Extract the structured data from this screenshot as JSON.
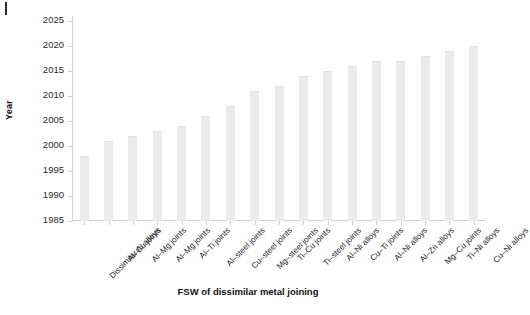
{
  "chart_data": {
    "type": "bar",
    "title": "",
    "xlabel": "FSW of dissimilar metal joining",
    "ylabel": "Year",
    "ylim": [
      1985,
      2025
    ],
    "ytick_step": 5,
    "yticks": [
      1985,
      1990,
      1995,
      2000,
      2005,
      2010,
      2015,
      2020,
      2025
    ],
    "grid": false,
    "legend": null,
    "bar_color": "#ebebeb",
    "categories": [
      "Dissimilar Al alloys",
      "Al–Cu joints",
      "Al–Mg joints",
      "Al–Mg joints",
      "Al–Ti joints",
      "Al–steel joints",
      "Cu–steel joints",
      "Mg–steel joints",
      "Ti–Cu joints",
      "Ti–steel joints",
      "Al–Ni alloys",
      "Cu–Ti joints",
      "Al–Ni alloys",
      "Al–Zn alloys",
      "Mg–Cu joints",
      "Ti–Ni alloys",
      "Cu–Ni alloys"
    ],
    "values": [
      1998,
      2001,
      2002,
      2003,
      2004,
      2006,
      2008,
      2011,
      2012,
      2014,
      2015,
      2016,
      2017,
      2017,
      2018,
      2019,
      2020
    ]
  },
  "artifacts": {
    "corner_mark": "crop-tick-mark"
  }
}
